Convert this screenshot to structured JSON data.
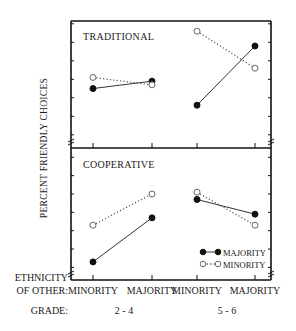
{
  "chart_data": [
    {
      "type": "line",
      "title": "TRADITIONAL",
      "ylabel": "PERCENT FRIENDLY CHOICES",
      "xlabel": "ETHNICITY OF OTHER / GRADE",
      "categories": [
        "MINORITY (2-4)",
        "MAJORITY (2-4)",
        "MINORITY (5-6)",
        "MAJORITY (5-6)"
      ],
      "yticks": [
        30,
        40,
        50
      ],
      "ylim": [
        25,
        56
      ],
      "series": [
        {
          "name": "MAJORITY",
          "style": "solid, filled circle",
          "values": [
            38.5,
            40.5,
            34,
            50
          ]
        },
        {
          "name": "MINORITY",
          "style": "dotted, open circle",
          "values": [
            41.5,
            39.5,
            54,
            44
          ]
        }
      ]
    },
    {
      "type": "line",
      "title": "COOPERATIVE",
      "ylabel": "PERCENT FRIENDLY CHOICES",
      "xlabel": "ETHNICITY OF OTHER / GRADE",
      "categories": [
        "MINORITY (2-4)",
        "MAJORITY (2-4)",
        "MINORITY (5-6)",
        "MAJORITY (5-6)"
      ],
      "yticks": [
        30,
        40,
        50
      ],
      "ylim": [
        25,
        57
      ],
      "series": [
        {
          "name": "MAJORITY",
          "style": "solid, filled circle",
          "values": [
            27.5,
            39.5,
            44.5,
            40.5
          ]
        },
        {
          "name": "MINORITY",
          "style": "dotted, open circle",
          "values": [
            37.5,
            46,
            46.5,
            37.5
          ]
        }
      ]
    }
  ],
  "labels": {
    "top_panel": "TRADITIONAL",
    "bottom_panel": "COOPERATIVE",
    "y_axis": "PERCENT FRIENDLY CHOICES",
    "ethnicity_1": "ETHNICITY",
    "ethnicity_2": "OF OTHER:",
    "grade": "GRADE:",
    "x_cats": [
      "MINORITY",
      "MAJORITY",
      "MINORITY",
      "MAJORITY"
    ],
    "grade_groups": [
      "2 - 4",
      "5 - 6"
    ],
    "yticks": [
      "50",
      "40",
      "30"
    ]
  },
  "legend": [
    {
      "label": "MAJORITY",
      "marker": "filled-circle",
      "line": "solid"
    },
    {
      "label": "MINORITY",
      "marker": "open-circle",
      "line": "dotted"
    }
  ]
}
